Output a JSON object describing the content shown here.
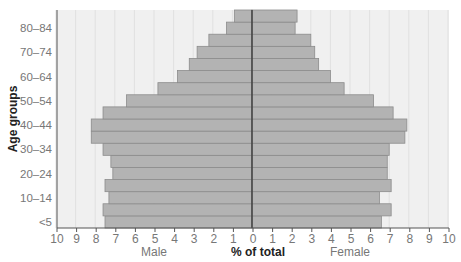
{
  "chart_data": {
    "type": "bar",
    "subtype": "population-pyramid",
    "title": "",
    "xlabel": "% of total",
    "ylabel": "Age groups",
    "xlim": [
      -10,
      10
    ],
    "x_ticks": [
      10,
      9,
      8,
      7,
      6,
      5,
      4,
      3,
      2,
      1,
      0,
      1,
      2,
      3,
      4,
      5,
      6,
      7,
      8,
      9,
      10
    ],
    "grid": true,
    "legend": null,
    "categories": [
      "<5",
      "5–9",
      "10–14",
      "15–19",
      "20–24",
      "25–29",
      "30–34",
      "35–39",
      "40–44",
      "45–49",
      "50–54",
      "55–59",
      "60–64",
      "65–69",
      "70–74",
      "75–79",
      "80–84",
      "85+"
    ],
    "visible_category_labels": [
      "<5",
      "10–14",
      "20–24",
      "30–34",
      "40–44",
      "50–54",
      "60–64",
      "70–74",
      "80–84"
    ],
    "series": [
      {
        "name": "Male",
        "side": "left",
        "values": [
          7.5,
          7.6,
          7.3,
          7.5,
          7.1,
          7.2,
          7.6,
          8.2,
          8.2,
          7.6,
          6.4,
          4.8,
          3.8,
          3.2,
          2.8,
          2.2,
          1.3,
          0.9
        ]
      },
      {
        "name": "Female",
        "side": "right",
        "values": [
          6.6,
          7.1,
          6.5,
          7.1,
          6.9,
          6.9,
          7.0,
          7.8,
          7.9,
          7.2,
          6.2,
          4.7,
          4.0,
          3.4,
          3.2,
          3.0,
          2.2,
          2.3
        ]
      }
    ],
    "side_labels": {
      "left": "Male",
      "right": "Female"
    },
    "colors": {
      "bar": "#b3b3b3",
      "bar_stroke": "#8c8c8c",
      "plot_bg": "#f0f0f0",
      "grid": "#e0e0e0",
      "axis": "#555555",
      "center_line": "#333333"
    }
  }
}
